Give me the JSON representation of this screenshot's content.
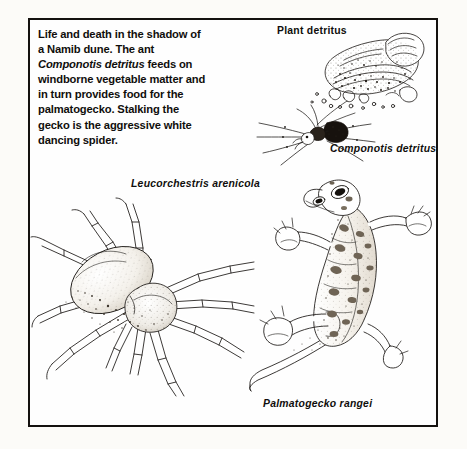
{
  "figure": {
    "kind": "scientific-illustration-plate",
    "frame_color": "#14110f",
    "ink_color": "#1a1714",
    "paper_color": "#fefefe",
    "page_background": "#fcfbf8"
  },
  "caption": {
    "text_before": "Life and death in the shadow of\na Namib dune. The ant\n",
    "species": "Componotis detritus",
    "text_after": " feeds on\nwindborne vegetable matter and\nin turn provides food for the\npalmatogecko. Stalking the\ngecko is the aggressive white\ndancing spider."
  },
  "labels": {
    "detritus": "Plant detritus",
    "ant": "Componotis detritus",
    "spider": "Leucorchestris arenicola",
    "gecko": "Palmatogecko rangei"
  },
  "organisms": [
    {
      "name": "plant-detritus",
      "label": "Plant detritus",
      "italic": false,
      "position": "top-right",
      "description": "crumpled windborne vegetable matter"
    },
    {
      "name": "ant",
      "label": "Componotis detritus",
      "italic": true,
      "position": "upper-right",
      "description": "dark long-legged ant feeding on detritus"
    },
    {
      "name": "white-dancing-spider",
      "label": "Leucorchestris arenicola",
      "italic": true,
      "position": "lower-left",
      "description": "pale long-legged dancing spider, dorsal view"
    },
    {
      "name": "palmatogecko",
      "label": "Palmatogecko rangei",
      "italic": true,
      "position": "right",
      "description": "web-footed gecko with spotted back and long curved tail"
    }
  ]
}
